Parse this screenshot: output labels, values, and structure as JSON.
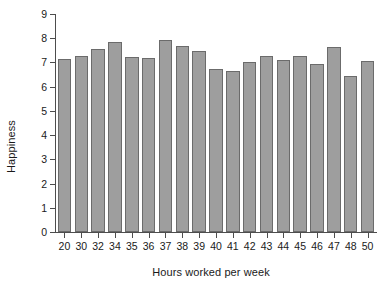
{
  "chart_data": {
    "type": "bar",
    "title": "",
    "xlabel": "Hours worked per week",
    "ylabel": "Happiness",
    "categories": [
      "20",
      "30",
      "32",
      "34",
      "35",
      "36",
      "37",
      "38",
      "39",
      "40",
      "41",
      "42",
      "43",
      "44",
      "45",
      "46",
      "47",
      "48",
      "50"
    ],
    "values": [
      7.15,
      7.25,
      7.57,
      7.85,
      7.23,
      7.19,
      7.93,
      7.7,
      7.48,
      6.72,
      6.65,
      7.0,
      7.27,
      7.12,
      7.27,
      6.92,
      7.65,
      6.45,
      7.05
    ],
    "ylim": [
      0,
      9
    ],
    "yticks": [
      "0",
      "1",
      "2",
      "3",
      "4",
      "5",
      "6",
      "7",
      "8",
      "9"
    ],
    "grid": false,
    "legend": "none",
    "bar_fill": "#9e9e9e",
    "bar_border": "#6b6b6b",
    "axis_color": "#4d4d4d",
    "background": "#ffffff"
  }
}
